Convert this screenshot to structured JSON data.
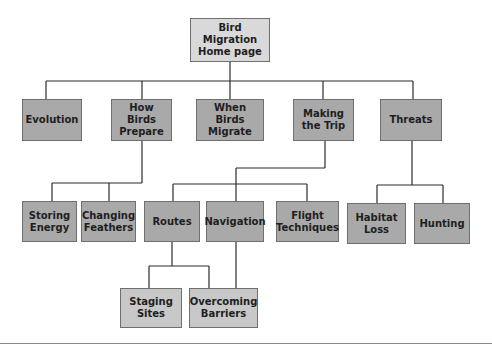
{
  "diagram": {
    "type": "site-map-tree",
    "colors": {
      "root_fill": "#d9d9d9",
      "node_fill": "#a9a9a9",
      "leaf_fill_level3": "#c8c8c8",
      "border": "#6f6f6f",
      "line": "#2a2a2a",
      "text": "#1e1e1e"
    },
    "nodes": [
      {
        "id": "root",
        "label": "Bird Migration\nHome page",
        "level": 0,
        "x": 190,
        "y": 18,
        "w": 80,
        "h": 44,
        "parent": null
      },
      {
        "id": "evolution",
        "label": "Evolution",
        "level": 1,
        "x": 22,
        "y": 99,
        "w": 60,
        "h": 42,
        "parent": "root"
      },
      {
        "id": "how-birds-prepare",
        "label": "How Birds\nPrepare",
        "level": 1,
        "x": 111,
        "y": 99,
        "w": 61,
        "h": 42,
        "parent": "root"
      },
      {
        "id": "when-birds-migrate",
        "label": "When Birds\nMigrate",
        "level": 1,
        "x": 196,
        "y": 99,
        "w": 68,
        "h": 42,
        "parent": "root"
      },
      {
        "id": "making-the-trip",
        "label": "Making\nthe Trip",
        "level": 1,
        "x": 293,
        "y": 99,
        "w": 61,
        "h": 42,
        "parent": "root"
      },
      {
        "id": "threats",
        "label": "Threats",
        "level": 1,
        "x": 380,
        "y": 99,
        "w": 62,
        "h": 42,
        "parent": "root"
      },
      {
        "id": "storing-energy",
        "label": "Storing\nEnergy",
        "level": 2,
        "x": 22,
        "y": 201,
        "w": 55,
        "h": 41,
        "parent": "how-birds-prepare"
      },
      {
        "id": "changing-feathers",
        "label": "Changing\nFeathers",
        "level": 2,
        "x": 81,
        "y": 201,
        "w": 55,
        "h": 41,
        "parent": "how-birds-prepare"
      },
      {
        "id": "routes",
        "label": "Routes",
        "level": 2,
        "x": 144,
        "y": 201,
        "w": 56,
        "h": 41,
        "parent": "making-the-trip"
      },
      {
        "id": "navigation",
        "label": "Navigation",
        "level": 2,
        "x": 206,
        "y": 201,
        "w": 58,
        "h": 41,
        "parent": "making-the-trip"
      },
      {
        "id": "flight-techniques",
        "label": "Flight\nTechniques",
        "level": 2,
        "x": 276,
        "y": 201,
        "w": 63,
        "h": 41,
        "parent": "making-the-trip"
      },
      {
        "id": "habitat-loss",
        "label": "Habitat\nLoss",
        "level": 2,
        "x": 347,
        "y": 203,
        "w": 59,
        "h": 41,
        "parent": "threats"
      },
      {
        "id": "hunting",
        "label": "Hunting",
        "level": 2,
        "x": 414,
        "y": 203,
        "w": 56,
        "h": 41,
        "parent": "threats"
      },
      {
        "id": "staging-sites",
        "label": "Staging\nSites",
        "level": 3,
        "x": 120,
        "y": 288,
        "w": 62,
        "h": 40,
        "parent": "routes"
      },
      {
        "id": "overcoming-barriers",
        "label": "Overcoming\nBarriers",
        "level": 3,
        "x": 189,
        "y": 288,
        "w": 69,
        "h": 40,
        "parent": "navigation"
      }
    ]
  }
}
